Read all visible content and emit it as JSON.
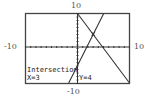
{
  "window": {
    "xmin": "-10",
    "xmax": "10",
    "ymin": "-10",
    "ymax": "10"
  },
  "readout": {
    "title": "Intersection",
    "x_value": "X=3",
    "y_value": "Y=4"
  },
  "colors": {
    "frame": "#444444",
    "graph": "#333333",
    "background": "#ffffff"
  },
  "chart_data": {
    "type": "line",
    "title": "",
    "xlabel": "",
    "ylabel": "",
    "xlim": [
      -10,
      10
    ],
    "ylim": [
      -10,
      10
    ],
    "tick_labels": {
      "x": [
        "-10",
        "10"
      ],
      "y": [
        "-10",
        "10"
      ]
    },
    "grid": false,
    "axes_ticks": "unit ticks on both axes",
    "series": [
      {
        "name": "y = -2x + 10",
        "points": [
          [
            0,
            10
          ],
          [
            3,
            4
          ],
          [
            10,
            -10
          ]
        ]
      },
      {
        "name": "y = 3x - 5",
        "points": [
          [
            -1.67,
            -10
          ],
          [
            3,
            4
          ],
          [
            5,
            10
          ]
        ]
      }
    ],
    "annotations": [
      {
        "type": "point",
        "label": "Intersection",
        "x": 3,
        "y": 4,
        "text": [
          "X=3",
          "Y=4"
        ]
      }
    ]
  }
}
